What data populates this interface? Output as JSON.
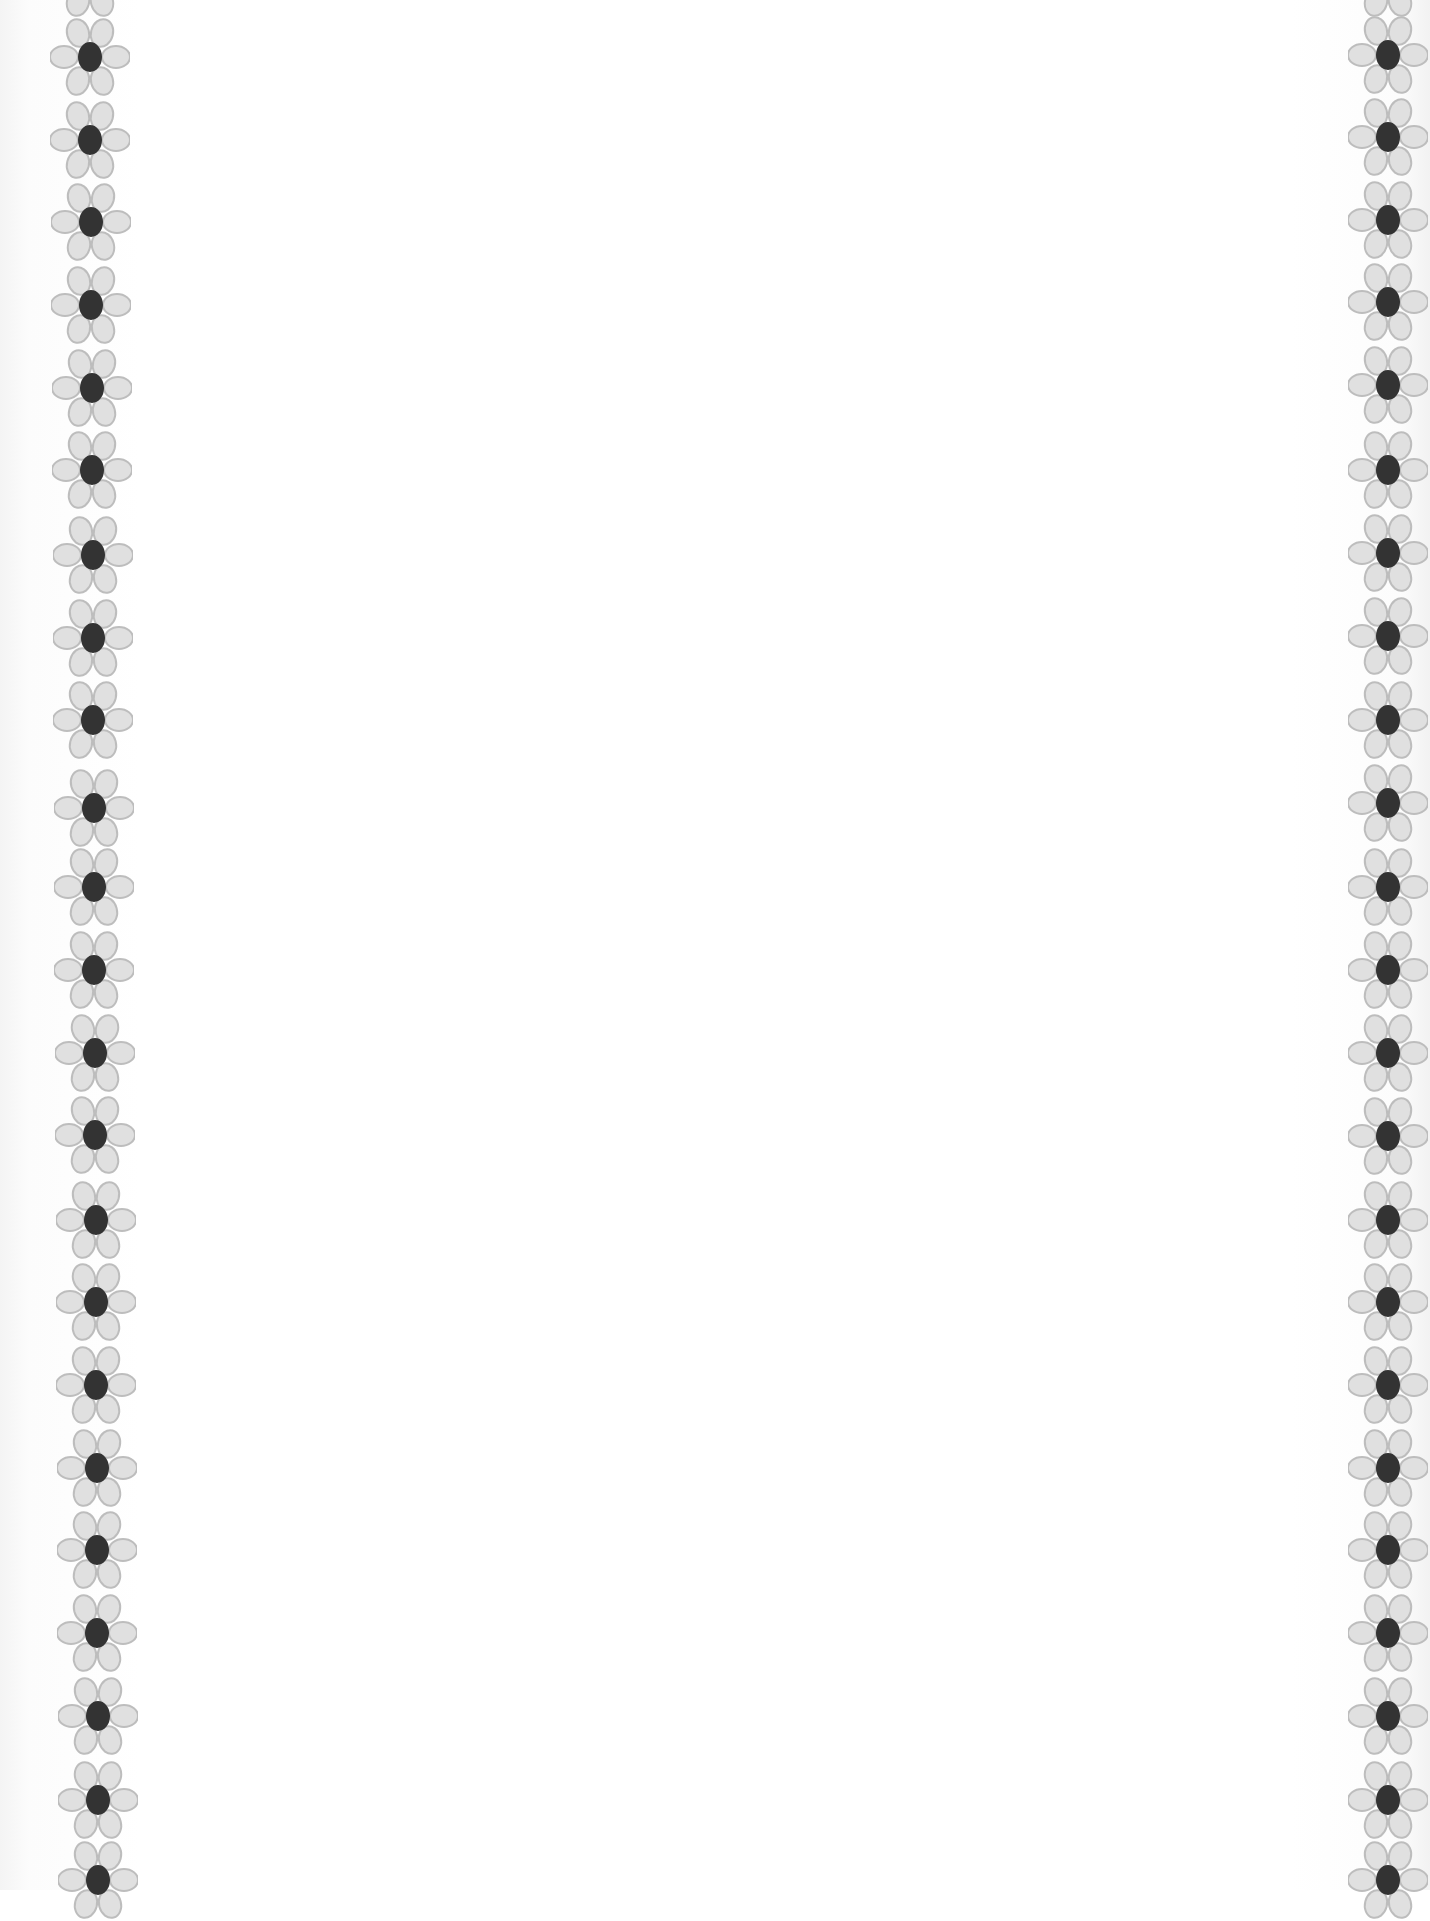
{
  "page": {
    "type": "blank-decorative-page",
    "background_color": "#ffffff",
    "content_text": ""
  },
  "decoration": {
    "motif": "six-petal-flower",
    "petal_fill": "#e0e0e0",
    "petal_stroke": "#bdbdbd",
    "center_fill": "#333333",
    "left_column": {
      "flowers": [
        {
          "cx": 90,
          "cy": -22
        },
        {
          "cx": 90,
          "cy": 57
        },
        {
          "cx": 90,
          "cy": 140
        },
        {
          "cx": 91,
          "cy": 222
        },
        {
          "cx": 91,
          "cy": 305
        },
        {
          "cx": 92,
          "cy": 388
        },
        {
          "cx": 92,
          "cy": 470
        },
        {
          "cx": 93,
          "cy": 555
        },
        {
          "cx": 93,
          "cy": 638
        },
        {
          "cx": 93,
          "cy": 720
        },
        {
          "cx": 94,
          "cy": 808
        },
        {
          "cx": 94,
          "cy": 887
        },
        {
          "cx": 94,
          "cy": 970
        },
        {
          "cx": 95,
          "cy": 1053
        },
        {
          "cx": 95,
          "cy": 1135
        },
        {
          "cx": 96,
          "cy": 1220
        },
        {
          "cx": 96,
          "cy": 1302
        },
        {
          "cx": 96,
          "cy": 1385
        },
        {
          "cx": 97,
          "cy": 1468
        },
        {
          "cx": 97,
          "cy": 1550
        },
        {
          "cx": 97,
          "cy": 1633
        },
        {
          "cx": 98,
          "cy": 1716
        },
        {
          "cx": 98,
          "cy": 1800
        },
        {
          "cx": 98,
          "cy": 1880
        }
      ]
    },
    "right_column": {
      "flowers": [
        {
          "cx": 1388,
          "cy": -22
        },
        {
          "cx": 1388,
          "cy": 55
        },
        {
          "cx": 1388,
          "cy": 137
        },
        {
          "cx": 1388,
          "cy": 220
        },
        {
          "cx": 1388,
          "cy": 302
        },
        {
          "cx": 1388,
          "cy": 385
        },
        {
          "cx": 1388,
          "cy": 470
        },
        {
          "cx": 1388,
          "cy": 553
        },
        {
          "cx": 1388,
          "cy": 636
        },
        {
          "cx": 1388,
          "cy": 720
        },
        {
          "cx": 1388,
          "cy": 803
        },
        {
          "cx": 1388,
          "cy": 887
        },
        {
          "cx": 1388,
          "cy": 970
        },
        {
          "cx": 1388,
          "cy": 1053
        },
        {
          "cx": 1388,
          "cy": 1136
        },
        {
          "cx": 1388,
          "cy": 1220
        },
        {
          "cx": 1388,
          "cy": 1302
        },
        {
          "cx": 1388,
          "cy": 1385
        },
        {
          "cx": 1388,
          "cy": 1468
        },
        {
          "cx": 1388,
          "cy": 1550
        },
        {
          "cx": 1388,
          "cy": 1633
        },
        {
          "cx": 1388,
          "cy": 1716
        },
        {
          "cx": 1388,
          "cy": 1800
        },
        {
          "cx": 1388,
          "cy": 1880
        }
      ]
    }
  }
}
